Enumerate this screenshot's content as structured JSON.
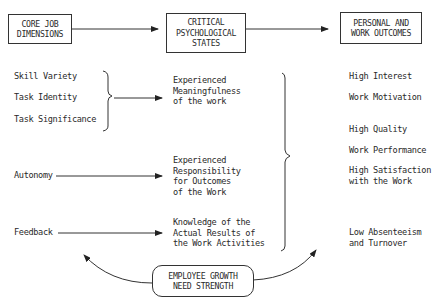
{
  "headers": {
    "core": "CORE JOB\nDIMENSIONS",
    "critical": "CRITICAL\nPSYCHOLOGICAL\nSTATES",
    "outcomes": "PERSONAL AND\nWORK OUTCOMES"
  },
  "core_dimensions": {
    "skill_variety": "Skill Variety",
    "task_identity": "Task Identity",
    "task_significance": "Task Significance",
    "autonomy": "Autonomy",
    "feedback": "Feedback"
  },
  "psychological_states": {
    "meaningfulness": "Experienced\nMeaningfulness\nof the work",
    "responsibility": "Experienced\nResponsibility\nfor Outcomes\nof the Work",
    "knowledge": "Knowledge of the\nActual Results of\nthe Work Activities"
  },
  "outcomes": {
    "high_interest": "High Interest",
    "work_motivation": "Work Motivation",
    "high_quality": "High Quality",
    "work_performance": "Work Performance",
    "high_satisfaction": "High Satisfaction\nwith the Work",
    "low_absenteeism": "Low Absenteeism\nand Turnover"
  },
  "moderator": "EMPLOYEE GROWTH\nNEED STRENGTH"
}
